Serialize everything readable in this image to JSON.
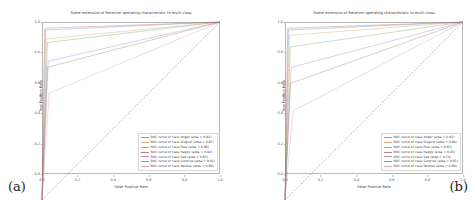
{
  "figure": {
    "panels": [
      {
        "tag": "(a)",
        "title": "Some extension of Receiver operating characteristic to multi-class",
        "xlabel": "False Positive Rate",
        "ylabel": "True Positive Rate"
      },
      {
        "tag": "(b)",
        "title": "Some extension of Receiver operating characteristic to multi-class",
        "xlabel": "False Positive Rate",
        "ylabel": "True Positive Rate"
      }
    ]
  },
  "chart_data": [
    {
      "type": "line",
      "panel": "(a)",
      "title": "Some extension of Receiver operating characteristic to multi-class",
      "xlabel": "False Positive Rate",
      "ylabel": "True Positive Rate",
      "xlim": [
        0.0,
        1.0
      ],
      "ylim": [
        0.0,
        1.0
      ],
      "xticks": [
        "0.0",
        "0.2",
        "0.4",
        "0.6",
        "0.8",
        "1.0"
      ],
      "yticks": [
        "0.0",
        "0.2",
        "0.4",
        "0.6",
        "0.8",
        "1.0"
      ],
      "grid": false,
      "legend_position": "lower right",
      "chance_line": {
        "label": "chance",
        "style": "dashed",
        "color": "#555555",
        "x": [
          0.0,
          1.0
        ],
        "y": [
          0.0,
          1.0
        ]
      },
      "series": [
        {
          "name": "ROC curve of class Anger (area = 0.91)",
          "class": "Anger",
          "area": 0.91,
          "color": "#3b7fb8",
          "x": [
            0.0,
            0.02,
            1.0
          ],
          "y": [
            0.0,
            0.955,
            1.0
          ]
        },
        {
          "name": "ROC curve of class Disgust (area = 0.87)",
          "class": "Disgust",
          "area": 0.87,
          "color": "#d98c3f",
          "x": [
            0.0,
            0.025,
            1.0
          ],
          "y": [
            0.0,
            0.905,
            1.0
          ]
        },
        {
          "name": "ROC curve of class Fear (area = 0.86)",
          "class": "Fear",
          "area": 0.86,
          "color": "#4f9c58",
          "x": [
            0.0,
            0.03,
            1.0
          ],
          "y": [
            0.0,
            0.885,
            1.0
          ]
        },
        {
          "name": "ROC curve of class Happy (area = 0.94)",
          "class": "Happy",
          "area": 0.94,
          "color": "#c4453f",
          "x": [
            0.0,
            0.015,
            1.0
          ],
          "y": [
            0.0,
            0.965,
            1.0
          ]
        },
        {
          "name": "ROC curve of class Sad (area = 0.83)",
          "class": "Sad",
          "area": 0.83,
          "color": "#9467bd",
          "x": [
            0.0,
            0.035,
            1.0
          ],
          "y": [
            0.0,
            0.78,
            1.0
          ]
        },
        {
          "name": "ROC curve of class Surprise (area = 0.91)",
          "class": "Surprise",
          "area": 0.91,
          "color": "#8c6350",
          "x": [
            0.0,
            0.03,
            1.0
          ],
          "y": [
            0.0,
            0.745,
            1.0
          ]
        },
        {
          "name": "ROC curve of class Neutral (area = 0.80)",
          "class": "Neutral",
          "area": 0.8,
          "color": "#d77fb4",
          "x": [
            0.0,
            0.04,
            1.0
          ],
          "y": [
            0.0,
            0.6,
            1.0
          ]
        }
      ]
    },
    {
      "type": "line",
      "panel": "(b)",
      "title": "Some extension of Receiver operating characteristic to multi-class",
      "xlabel": "False Positive Rate",
      "ylabel": "True Positive Rate",
      "xlim": [
        0.0,
        1.0
      ],
      "ylim": [
        0.0,
        1.0
      ],
      "xticks": [
        "0.0",
        "0.2",
        "0.4",
        "0.6",
        "0.8",
        "1.0"
      ],
      "yticks": [
        "0.0",
        "0.2",
        "0.4",
        "0.6",
        "0.8",
        "1.0"
      ],
      "grid": false,
      "legend_position": "lower right",
      "chance_line": {
        "label": "chance",
        "style": "dashed",
        "color": "#555555",
        "x": [
          0.0,
          1.0
        ],
        "y": [
          0.0,
          1.0
        ]
      },
      "series": [
        {
          "name": "ROC curve of class Anger (area = 0.92)",
          "class": "Anger",
          "area": 0.92,
          "color": "#3b7fb8",
          "x": [
            0.0,
            0.02,
            1.0
          ],
          "y": [
            0.0,
            0.955,
            1.0
          ]
        },
        {
          "name": "ROC curve of class Disgust (area = 0.90)",
          "class": "Disgust",
          "area": 0.9,
          "color": "#d98c3f",
          "x": [
            0.0,
            0.025,
            1.0
          ],
          "y": [
            0.0,
            0.925,
            1.0
          ]
        },
        {
          "name": "ROC curve of class Fear (area = 0.83)",
          "class": "Fear",
          "area": 0.83,
          "color": "#4f9c58",
          "x": [
            0.0,
            0.03,
            1.0
          ],
          "y": [
            0.0,
            0.86,
            1.0
          ]
        },
        {
          "name": "ROC curve of class Happy (area = 0.95)",
          "class": "Happy",
          "area": 0.95,
          "color": "#c4453f",
          "x": [
            0.0,
            0.015,
            1.0
          ],
          "y": [
            0.0,
            0.965,
            1.0
          ]
        },
        {
          "name": "ROC curve of class Sad (area = 0.74)",
          "class": "Sad",
          "area": 0.74,
          "color": "#9467bd",
          "x": [
            0.0,
            0.035,
            1.0
          ],
          "y": [
            0.0,
            0.745,
            1.0
          ]
        },
        {
          "name": "ROC curve of class Surprise (area = 0.91)",
          "class": "Surprise",
          "area": 0.91,
          "color": "#8c6350",
          "x": [
            0.0,
            0.03,
            1.0
          ],
          "y": [
            0.0,
            0.655,
            1.0
          ]
        },
        {
          "name": "ROC curve of class Neutral (area = 0.80)",
          "class": "Neutral",
          "area": 0.8,
          "color": "#d77fb4",
          "x": [
            0.0,
            0.045,
            1.0
          ],
          "y": [
            0.0,
            0.5,
            1.0
          ]
        }
      ]
    }
  ]
}
